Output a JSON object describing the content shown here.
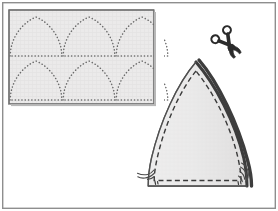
{
  "illustration": {
    "title": "Sewing pattern: cutting dome-shaped fabric panels",
    "caption": "",
    "canvas": {
      "width": 278,
      "height": 211
    },
    "colors": {
      "page_background": "#ffffff",
      "outer_frame_stroke": "#8e8e8e",
      "fabric_fill": "#ebeaea",
      "fabric_stroke": "#6e6e6e",
      "fabric_shadow": "#b8b8b8",
      "dotted_marking": "#6b6b6b",
      "panel_fill": "#e3e2e2",
      "panel_light_fill": "#f2f2f2",
      "panel_outline": "#5d5d5d",
      "seam_dashed": "#3a3a3a",
      "cut_edge_dark": "#3d3d3d",
      "thread": "#4a4a4a",
      "scissors_body": "#2b2b2b"
    },
    "frame": {
      "name": "outer-border",
      "x": 2,
      "y": 2,
      "width": 274,
      "height": 207,
      "stroke_width": 1.4
    },
    "fabric_panel": {
      "label": "marked fabric sheet",
      "x": 9,
      "y": 10,
      "width": 145,
      "height": 94,
      "shadow_offset": 2,
      "rows": 2,
      "columns": 3,
      "shape_count": 6,
      "shape_kind": "dotted-dome-outline",
      "dot_radius": 0.85,
      "shapes": [
        {
          "id": "dome-1",
          "row": 1,
          "col": 1,
          "cx": 36,
          "baseline_y": 56,
          "apex_y": 17,
          "half_width": 26
        },
        {
          "id": "dome-2",
          "row": 1,
          "col": 2,
          "cx": 89,
          "baseline_y": 56,
          "apex_y": 17,
          "half_width": 26
        },
        {
          "id": "dome-3",
          "row": 1,
          "col": 3,
          "cx": 142,
          "baseline_y": 56,
          "apex_y": 17,
          "half_width": 26
        },
        {
          "id": "dome-4",
          "row": 2,
          "col": 1,
          "cx": 36,
          "baseline_y": 100,
          "apex_y": 61,
          "half_width": 26
        },
        {
          "id": "dome-5",
          "row": 2,
          "col": 2,
          "cx": 89,
          "baseline_y": 100,
          "apex_y": 61,
          "half_width": 26
        },
        {
          "id": "dome-6",
          "row": 2,
          "col": 3,
          "cx": 142,
          "baseline_y": 100,
          "apex_y": 61,
          "half_width": 26
        }
      ]
    },
    "scissors": {
      "label": "scissors",
      "icon": "scissors-icon",
      "center_x": 230,
      "center_y": 46,
      "rotation_degrees": -38,
      "scale": 1.0
    },
    "cut_piece": {
      "label": "cut dome panel",
      "apex_x": 196,
      "apex_y": 62,
      "left_base_x": 148,
      "right_base_x": 247,
      "baseline_y": 186,
      "seam_dash_pattern": "5 3.2",
      "cut_edge_width": 3.2,
      "threads": [
        {
          "id": "thread-left",
          "x": 152,
          "y": 172
        },
        {
          "id": "thread-right",
          "x": 243,
          "y": 168
        }
      ]
    }
  }
}
